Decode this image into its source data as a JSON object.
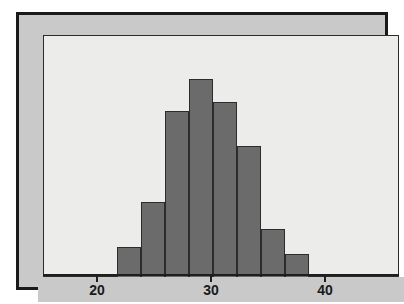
{
  "figure": {
    "title": "",
    "background_color": "#c9c9c9",
    "panel_color": "#ececeb",
    "frame_color": "#1a1a1a",
    "bar_color": "#6b6b6b",
    "bar_edge_color": "#2c2c2c"
  },
  "axis": {
    "tick_labels": [
      "20",
      "30",
      "40"
    ],
    "tick_values": [
      20,
      30,
      40
    ],
    "tick_positions_px": [
      76,
      190,
      304
    ]
  },
  "chart_data": {
    "type": "bar",
    "title": "",
    "subtitle": "",
    "xlabel": "",
    "ylabel": "",
    "grid": false,
    "legend": false,
    "xlim": [
      13.4,
      44.5
    ],
    "ylim": [
      0,
      100
    ],
    "bin_width": 2.1,
    "bin_edges": [
      15.4,
      17.5,
      19.6,
      21.7,
      23.8,
      25.9,
      28.0,
      30.1,
      32.2,
      34.3,
      36.4,
      38.5,
      40.6,
      42.7
    ],
    "categories": [
      "15.4-17.5",
      "17.5-19.6",
      "19.6-21.7",
      "21.7-23.8",
      "23.8-25.9",
      "25.9-28.0",
      "28.0-30.1",
      "30.1-32.2",
      "32.2-34.3",
      "34.3-36.4",
      "36.4-38.5",
      "38.5-40.6",
      "40.6-42.7"
    ],
    "bin_centers": [
      16.5,
      18.6,
      20.7,
      22.8,
      24.9,
      27.0,
      29.1,
      31.2,
      33.3,
      35.4,
      37.5,
      39.6,
      41.7
    ],
    "values": [
      3,
      8,
      21,
      40,
      85,
      91,
      81,
      62,
      28,
      18,
      7,
      2.5,
      0.4
    ],
    "bar_pixel_heights": [
      7,
      18,
      50,
      95,
      186,
      218,
      195,
      151,
      68,
      43,
      17,
      6,
      1
    ],
    "bar_pixel_left": [
      0,
      24,
      48,
      72,
      96,
      120,
      144,
      168,
      192,
      216,
      240,
      264,
      288
    ],
    "bar_pixel_width": 24
  }
}
